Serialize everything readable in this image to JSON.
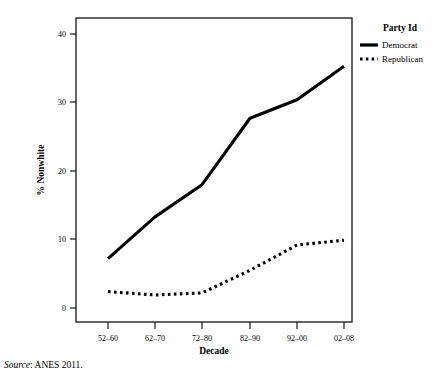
{
  "chart_data": {
    "type": "line",
    "title": "",
    "xlabel": "Decade",
    "ylabel": "% Nonwhite",
    "categories": [
      "52–60",
      "62–70",
      "72–80",
      "82–90",
      "92–00",
      "02–08"
    ],
    "ylim": [
      0,
      42
    ],
    "yticks": [
      0,
      10,
      20,
      30,
      40
    ],
    "ytick_labels": [
      "0",
      "10",
      "20",
      "30",
      "40"
    ],
    "grid": false,
    "legend_position": "right",
    "series": [
      {
        "name": "Democrat",
        "style": "solid",
        "color": "#000000",
        "values": [
          7.2,
          13.3,
          18.0,
          27.7,
          30.4,
          35.3
        ]
      },
      {
        "name": "Republican",
        "style": "dotted",
        "color": "#000000",
        "values": [
          2.4,
          1.9,
          2.2,
          5.5,
          9.2,
          9.9
        ]
      }
    ]
  },
  "legend": {
    "title": "Party Id",
    "entries": [
      {
        "label": "Democrat",
        "swatch": "solid-line-swatch"
      },
      {
        "label": "Republican",
        "swatch": "dotted-line-swatch"
      }
    ]
  },
  "source": {
    "prefix": "Source",
    "separator": ": ",
    "text": "ANES 2011."
  }
}
